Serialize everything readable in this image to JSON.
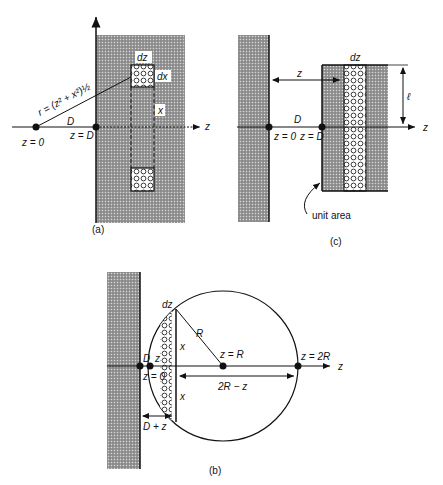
{
  "figure": {
    "panel_a": {
      "caption": "(a)",
      "labels": {
        "dz": "dz",
        "dx": "dx",
        "x": "x",
        "r": "r = (z² + x²)½",
        "D": "D",
        "z0": "z = 0",
        "zD": "z = D",
        "axis": "z"
      }
    },
    "panel_c": {
      "caption": "(c)",
      "labels": {
        "dz": "dz",
        "z": "z",
        "l": "ℓ",
        "D": "D",
        "z0": "z = 0",
        "zD": "z = D",
        "axis": "z",
        "unit_area": "unit area"
      }
    },
    "panel_b": {
      "caption": "(b)",
      "labels": {
        "dz": "dz",
        "R": "R",
        "x_top": "x",
        "x_bottom": "x",
        "D": "D",
        "z": "z",
        "z0": "z = 0",
        "zR": "z = R",
        "z2R": "z = 2R",
        "two_r_minus_z": "2R − z",
        "d_plus_z": "D + z",
        "axis": "z"
      }
    }
  }
}
